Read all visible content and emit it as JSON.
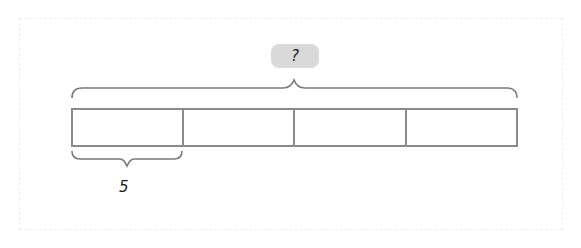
{
  "diagram": {
    "type": "tape-diagram",
    "total_label": "?",
    "segment_count": 4,
    "segment_label": "5",
    "colors": {
      "line": "#7a7a7a",
      "badge_bg": "#d9d9d9",
      "text": "#222222"
    }
  }
}
